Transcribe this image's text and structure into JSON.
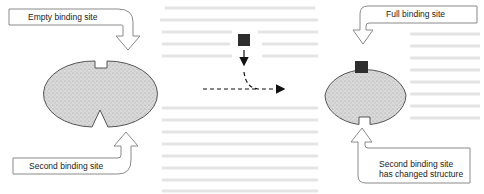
{
  "figure": {
    "callouts": {
      "empty_site": "Empty binding site",
      "second_site_left": "Second binding site",
      "full_site": "Full binding site",
      "second_site_right_line1": "Second binding site",
      "second_site_right_line2": "has changed structure"
    },
    "colors": {
      "protein_fill": "#d6d6d6",
      "protein_stroke": "#555555",
      "ligand": "#2e2e2e",
      "callout_stroke": "#8a8a8a",
      "arrow": "#111111"
    },
    "elements": {
      "left_protein": "protein with empty binding site (top) and V-shaped second binding site (bottom)",
      "ligand": "dark square ligand",
      "transition_arrow": "dashed arrow indicating ligand binding",
      "right_protein": "protein with ligand bound (top) and changed second binding site (bottom)"
    }
  }
}
